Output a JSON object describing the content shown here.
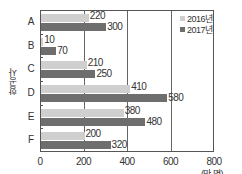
{
  "chart_data": {
    "type": "bar",
    "orientation": "horizontal",
    "title": "",
    "xlabel": "(만 명)",
    "ylabel": "항공사",
    "categories": [
      "A",
      "B",
      "C",
      "D",
      "E",
      "F"
    ],
    "series": [
      {
        "name": "2016년",
        "color": "#cfcfcf",
        "values": [
          220,
          10,
          210,
          410,
          380,
          200
        ]
      },
      {
        "name": "2017년",
        "color": "#6e6e6e",
        "values": [
          300,
          70,
          250,
          580,
          480,
          320
        ]
      }
    ],
    "xlim": [
      0,
      800
    ],
    "xticks": [
      0,
      200,
      400,
      600,
      800
    ],
    "grid": "vertical at 200, 400, 600",
    "legend_position": "top-right inside plot"
  },
  "labels": {
    "ylabel": "항공사",
    "unit": "(만 명)",
    "legend_2016": "2016년",
    "legend_2017": "2017년"
  }
}
